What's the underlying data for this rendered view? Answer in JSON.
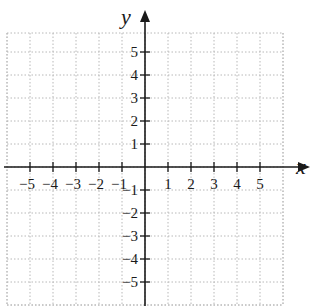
{
  "diagram": {
    "type": "coordinate-plane",
    "x_axis": {
      "label": "x",
      "min": -5,
      "max": 5,
      "ticks": [
        -5,
        -4,
        -3,
        -2,
        -1,
        1,
        2,
        3,
        4,
        5
      ],
      "tick_labels": [
        "−5",
        "−4",
        "−3",
        "−2",
        "−1",
        "1",
        "2",
        "3",
        "4",
        "5"
      ]
    },
    "y_axis": {
      "label": "y",
      "min": -5,
      "max": 5,
      "ticks": [
        -5,
        -4,
        -3,
        -2,
        -1,
        1,
        2,
        3,
        4,
        5
      ],
      "tick_labels": [
        "−5",
        "−4",
        "−3",
        "−2",
        "−1",
        "1",
        "2",
        "3",
        "4",
        "5"
      ]
    },
    "grid": {
      "style": "dotted",
      "spacing": 1,
      "extent": [
        -6,
        6
      ]
    },
    "colors": {
      "axis": "#1a1a1a",
      "grid": "#b8b8b8",
      "background": "#ffffff"
    }
  }
}
